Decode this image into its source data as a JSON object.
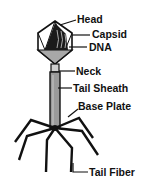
{
  "labels": {
    "head": "Head",
    "capsid": "Capsid",
    "dna": "DNA",
    "neck": "Neck",
    "tail_sheath": "Tail Sheath",
    "base_plate": "Base Plate",
    "tail_fiber": "Tail Fiber"
  },
  "colors": {
    "outline": "#111111",
    "capsid_fill": "#ffffff",
    "capsid_lower": "#a8a8a8",
    "dna": "#1a1a1a",
    "neck": "#d0d0d0",
    "sheath": "#9a9a9a"
  }
}
